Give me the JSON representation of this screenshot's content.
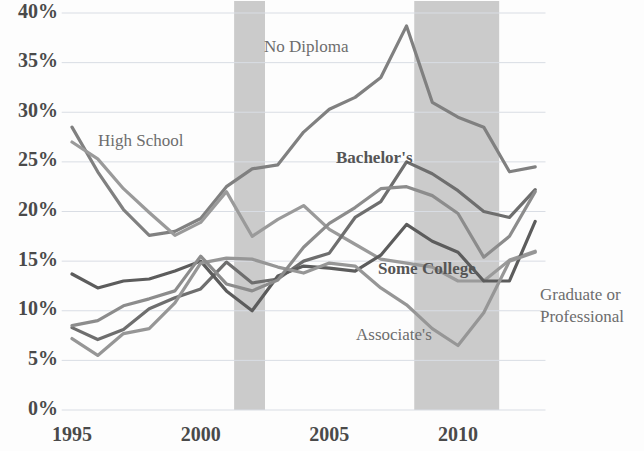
{
  "chart_data": {
    "type": "line",
    "title": "",
    "subtitle": "",
    "xlabel": "",
    "ylabel": "",
    "xlim": [
      1994.6,
      2013.4
    ],
    "ylim": [
      0,
      40
    ],
    "grid": true,
    "legend_position": "inline-labels",
    "y_ticks": [
      "0%",
      "5%",
      "10%",
      "15%",
      "20%",
      "25%",
      "30%",
      "35%",
      "40%"
    ],
    "y_tick_values": [
      0,
      5,
      10,
      15,
      20,
      25,
      30,
      35,
      40
    ],
    "x_ticks": [
      "1995",
      "2000",
      "2005",
      "2010"
    ],
    "x_tick_values": [
      1995,
      2000,
      2005,
      2010
    ],
    "x": [
      1995,
      1996,
      1997,
      1998,
      1999,
      2000,
      2001,
      2002,
      2003,
      2004,
      2005,
      2006,
      2007,
      2008,
      2009,
      2010,
      2011,
      2012,
      2013
    ],
    "shaded_bands": [
      {
        "name": "recession-2001",
        "start": 2001.3,
        "end": 2002.5,
        "color": "#c2c2c2"
      },
      {
        "name": "recession-2008",
        "start": 2008.3,
        "end": 2011.6,
        "color": "#c2c2c2"
      }
    ],
    "series": [
      {
        "name": "No Diploma",
        "label": "No Diploma",
        "color": "#808080",
        "bold_label": false,
        "label_x": 264,
        "label_y": 52,
        "values": [
          28.5,
          24.0,
          20.2,
          17.6,
          18.0,
          19.3,
          22.5,
          24.3,
          24.7,
          28.0,
          30.3,
          31.5,
          33.5,
          38.7,
          31.0,
          29.5,
          28.5,
          24.0,
          24.5
        ]
      },
      {
        "name": "High School",
        "label": "High School",
        "color": "#9a9a9a",
        "bold_label": false,
        "label_x": 98,
        "label_y": 146,
        "values": [
          27.0,
          25.3,
          22.3,
          19.9,
          17.6,
          18.9,
          22.0,
          17.5,
          19.2,
          20.6,
          18.2,
          16.7,
          15.2,
          14.8,
          14.4,
          13.0,
          13.0,
          15.1,
          16.0
        ]
      },
      {
        "name": "Bachelor's",
        "label": "Bachelor's",
        "color": "#6e6e6e",
        "bold_label": true,
        "label_x": 336,
        "label_y": 163,
        "values": [
          8.3,
          7.1,
          8.1,
          10.2,
          11.3,
          12.2,
          14.9,
          12.8,
          13.2,
          15.0,
          15.8,
          19.4,
          21.0,
          25.0,
          23.8,
          22.1,
          20.0,
          19.4,
          22.2
        ]
      },
      {
        "name": "Some College",
        "label": "Some College",
        "color": "#5c5c5c",
        "bold_label": true,
        "label_x": 378,
        "label_y": 274,
        "values": [
          13.7,
          12.3,
          13.0,
          13.2,
          14.0,
          15.0,
          12.0,
          10.0,
          13.5,
          14.5,
          14.3,
          14.0,
          15.6,
          18.7,
          17.0,
          15.9,
          13.0,
          13.0,
          19.0
        ]
      },
      {
        "name": "Associate's",
        "label": "Associate's",
        "color": "#969696",
        "bold_label": false,
        "label_x": 356,
        "label_y": 340,
        "values": [
          7.2,
          5.5,
          7.7,
          8.2,
          10.8,
          14.8,
          15.3,
          15.2,
          14.4,
          13.8,
          14.8,
          14.5,
          12.3,
          10.6,
          8.2,
          6.5,
          9.8,
          15.0,
          15.9
        ]
      },
      {
        "name": "Graduate or Professional",
        "label": "Graduate or\nProfessional",
        "label_line1": "Graduate or",
        "label_line2": "Professional",
        "color": "#8c8c8c",
        "bold_label": false,
        "label_x": 540,
        "label_y": 300,
        "values": [
          8.5,
          9.0,
          10.5,
          11.2,
          12.0,
          15.5,
          12.7,
          12.0,
          13.1,
          16.4,
          18.8,
          20.4,
          22.3,
          22.5,
          21.6,
          19.8,
          15.4,
          17.5,
          22.0
        ]
      }
    ]
  },
  "axes": {
    "y_label_text": "",
    "x_label_text": ""
  }
}
